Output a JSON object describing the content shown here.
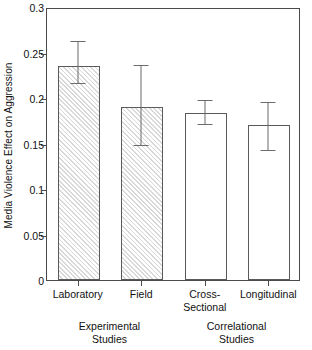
{
  "chart_data": {
    "type": "bar",
    "title": "",
    "xlabel": "",
    "ylabel": "Media Violence Effect on Aggression",
    "ylim": [
      0,
      0.3
    ],
    "ytick_labels": [
      "0",
      "0.05",
      "0.1",
      "0.15",
      "0.2",
      "0.25",
      "0.3"
    ],
    "ytick_values": [
      0,
      0.05,
      0.1,
      0.15,
      0.2,
      0.25,
      0.3
    ],
    "grid": false,
    "legend_position": "none",
    "categories": [
      "Laboratory",
      "Field",
      "Cross-\nSectional",
      "Longitudinal"
    ],
    "values": [
      0.235,
      0.19,
      0.183,
      0.17
    ],
    "errors_upper": [
      0.264,
      0.237,
      0.199,
      0.197
    ],
    "errors_lower": [
      0.218,
      0.149,
      0.173,
      0.144
    ],
    "bar_styles": [
      "hatched",
      "hatched",
      "open",
      "open"
    ],
    "groups": [
      {
        "label": "Experimental\nStudies",
        "categories": [
          "Laboratory",
          "Field"
        ]
      },
      {
        "label": "Correlational\nStudies",
        "categories": [
          "Cross-\nSectional",
          "Longitudinal"
        ]
      }
    ]
  },
  "colors": {
    "axis": "#4a4a4a",
    "bar_edge": "#5a5a5a",
    "hatch": "#d8d8d8",
    "error": "#6b6b6b",
    "background": "#ffffff",
    "text": "#111111"
  }
}
